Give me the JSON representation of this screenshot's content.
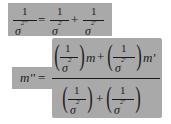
{
  "equations": {
    "precision": {
      "lhs": {
        "numerator": "1",
        "denominator": "σ",
        "sup": "2''"
      },
      "equals": "=",
      "term1": {
        "numerator": "1",
        "denominator": "σ",
        "sup": "2"
      },
      "plus": "+",
      "term2": {
        "numerator": "1",
        "denominator": "σ",
        "sup": "2'"
      }
    },
    "mean": {
      "lhs": "m''",
      "equals": "=",
      "numerator": {
        "term1": {
          "numerator": "1",
          "denominator": "σ",
          "sup": "2",
          "factor": "m"
        },
        "plus": "+",
        "term2": {
          "numerator": "1",
          "denominator": "σ",
          "sup": "2'",
          "factor": "m'"
        }
      },
      "denominator": {
        "term1": {
          "numerator": "1",
          "denominator": "σ",
          "sup": "2"
        },
        "plus": "+",
        "term2": {
          "numerator": "1",
          "denominator": "σ",
          "sup": "2'"
        }
      }
    }
  },
  "colors": {
    "highlight": "#a9a9a9",
    "ink": "#1a1a1a",
    "background": "#ffffff"
  }
}
